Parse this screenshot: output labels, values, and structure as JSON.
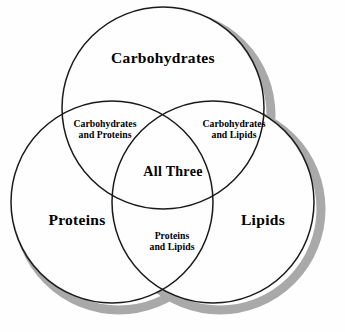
{
  "diagram": {
    "type": "venn-3-set",
    "background_color": "#fefefe",
    "stroke_color": "#1a1a1a",
    "shadow_color": "#a9a9a9",
    "text_color": "#000000",
    "sets": [
      {
        "id": "carbohydrates",
        "label": "Carbohydrates",
        "position": "top",
        "center_x": 163,
        "center_y": 108,
        "radius": 101
      },
      {
        "id": "proteins",
        "label": "Proteins",
        "position": "bottom-left",
        "center_x": 112,
        "center_y": 202,
        "radius": 101
      },
      {
        "id": "lipids",
        "label": "Lipids",
        "position": "bottom-right",
        "center_x": 213,
        "center_y": 202,
        "radius": 101
      }
    ],
    "intersections": [
      {
        "id": "carbohydrates-proteins",
        "label": "Carbohydrates\nand Proteins",
        "line_1": "Carbohydrates",
        "line_2": "and Proteins"
      },
      {
        "id": "carbohydrates-lipids",
        "label": "Carbohydrates\nand Lipids",
        "line_1": "Carbohydrates",
        "line_2": "and Lipids"
      },
      {
        "id": "proteins-lipids",
        "label": "Proteins\nand Lipids",
        "line_1": "Proteins",
        "line_2": "and Lipids"
      },
      {
        "id": "all-three",
        "label": "All Three"
      }
    ]
  }
}
